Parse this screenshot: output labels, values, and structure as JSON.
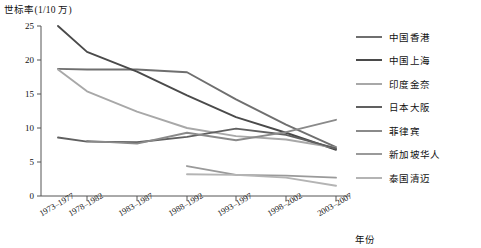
{
  "chart_data": {
    "type": "line",
    "title": "",
    "ylabel": "世标率(1/10 万)",
    "xlabel": "年份",
    "ylim": [
      0,
      25
    ],
    "yticks": [
      0,
      5,
      10,
      15,
      20,
      25
    ],
    "grid": false,
    "legend_position": "right",
    "categories": [
      "1973–1977",
      "1978–1982",
      "1983–1987",
      "1988–1992",
      "1993–1997",
      "1998–2002",
      "2003–2007"
    ],
    "series": [
      {
        "name": "中国香港",
        "color": "#6f6f6f",
        "values": [
          18.7,
          18.6,
          18.6,
          18.2,
          14.2,
          10.5,
          7.2
        ]
      },
      {
        "name": "中国上海",
        "color": "#4a4a4a",
        "values": [
          25.0,
          21.2,
          18.3,
          14.8,
          11.6,
          9.3,
          6.8
        ]
      },
      {
        "name": "印度金奈",
        "color": "#a8a8a8",
        "values": [
          18.6,
          15.4,
          12.4,
          10.0,
          8.8,
          8.3,
          7.1
        ]
      },
      {
        "name": "日本大阪",
        "color": "#606060",
        "values": [
          8.6,
          8.0,
          7.9,
          8.7,
          9.9,
          9.0,
          7.0
        ]
      },
      {
        "name": "菲律宾",
        "color": "#8a8a8a",
        "values": [
          null,
          8.1,
          7.7,
          9.3,
          8.2,
          9.4,
          11.2
        ]
      },
      {
        "name": "新加坡华人",
        "color": "#9a9a9a",
        "values": [
          null,
          null,
          null,
          4.4,
          3.1,
          3.0,
          2.7
        ]
      },
      {
        "name": "泰国清迈",
        "color": "#b4b4b4",
        "values": [
          null,
          null,
          null,
          3.2,
          3.1,
          2.7,
          1.5
        ]
      }
    ],
    "axis_geometry": {
      "plot_left": 41,
      "plot_right": 350,
      "plot_top": 26,
      "plot_bottom": 196,
      "x_positions": [
        58,
        87,
        137,
        187,
        236,
        286,
        336
      ]
    }
  },
  "legend": {
    "items": [
      {
        "label": "中国香港",
        "color": "#6f6f6f"
      },
      {
        "label": "中国上海",
        "color": "#4a4a4a"
      },
      {
        "label": "印度金奈",
        "color": "#a8a8a8"
      },
      {
        "label": "日本大阪",
        "color": "#606060"
      },
      {
        "label": "菲律宾",
        "color": "#8a8a8a"
      },
      {
        "label": "新加坡华人",
        "color": "#9a9a9a"
      },
      {
        "label": "泰国清迈",
        "color": "#b4b4b4"
      }
    ]
  }
}
